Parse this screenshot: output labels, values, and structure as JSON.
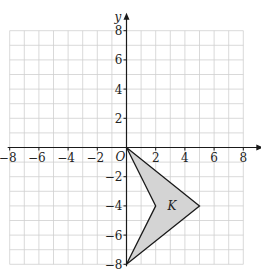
{
  "diagram": {
    "type": "coordinate-grid",
    "axes": {
      "x_label": "x",
      "y_label": "y",
      "origin_label": "O",
      "x_range": [
        -8,
        8
      ],
      "y_range": [
        -8,
        8
      ],
      "grid_step": 1,
      "tick_step": 2,
      "x_ticks": [
        "−8",
        "−6",
        "−4",
        "−2",
        "2",
        "4",
        "6",
        "8"
      ],
      "x_tick_values": [
        -8,
        -6,
        -4,
        -2,
        2,
        4,
        6,
        8
      ],
      "y_ticks": [
        "8",
        "6",
        "4",
        "2",
        "−2",
        "−4",
        "−6",
        "−8"
      ],
      "y_tick_values": [
        8,
        6,
        4,
        2,
        -2,
        -4,
        -6,
        -8
      ]
    },
    "shape": {
      "label": "K",
      "vertices": [
        [
          0,
          0
        ],
        [
          5,
          -4
        ],
        [
          0,
          -8
        ],
        [
          2,
          -4
        ]
      ],
      "fill": "#d4d4d4",
      "stroke": "#1a1a1a"
    },
    "colors": {
      "grid": "#cfcfcf",
      "axis": "#1a1a1a"
    }
  }
}
